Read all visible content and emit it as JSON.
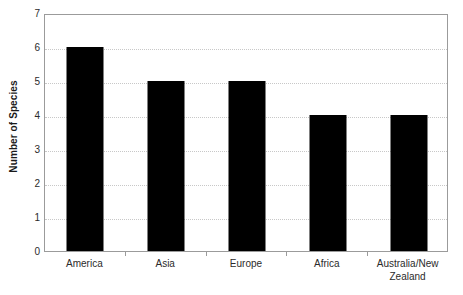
{
  "chart_data": {
    "type": "bar",
    "title": "",
    "xlabel": "",
    "ylabel": "Number of Species",
    "categories": [
      "America",
      "Asia",
      "Europe",
      "Africa",
      "Australia/New Zealand"
    ],
    "category_lines": [
      [
        "America"
      ],
      [
        "Asia"
      ],
      [
        "Europe"
      ],
      [
        "Africa"
      ],
      [
        "Australia/New",
        "Zealand"
      ]
    ],
    "values": [
      6,
      5,
      5,
      4,
      4
    ],
    "ylim": [
      0,
      7
    ],
    "ytick_labels": [
      "0",
      "1",
      "2",
      "3",
      "4",
      "5",
      "6",
      "7"
    ],
    "ytick_values": [
      0,
      1,
      2,
      3,
      4,
      5,
      6,
      7
    ],
    "grid": true,
    "grid_axis": "y",
    "grid_style": "dotted",
    "legend": false,
    "legend_position": "none",
    "bar_color": "#000000",
    "grid_color": "#c8c8c8",
    "axis_color": "#9b9b9b",
    "background_color": "#ffffff",
    "text_color": "#2b2b2b"
  }
}
